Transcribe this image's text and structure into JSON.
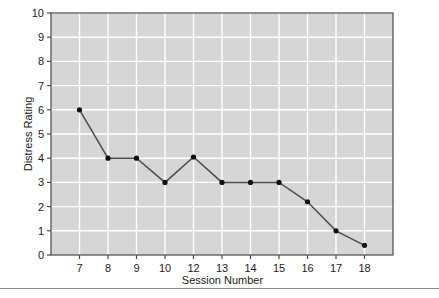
{
  "chart_data": {
    "type": "line",
    "title": "",
    "xlabel": "Session Number",
    "ylabel": "Distress Rating",
    "categories": [
      "7",
      "8",
      "9",
      "10",
      "12",
      "13",
      "14",
      "15",
      "16",
      "17",
      "18"
    ],
    "values": [
      6.0,
      4.0,
      4.0,
      3.0,
      4.05,
      3.0,
      3.0,
      3.0,
      2.2,
      1.0,
      0.4
    ],
    "series": [
      {
        "name": "Distress Rating",
        "values": [
          6.0,
          4.0,
          4.0,
          3.0,
          4.05,
          3.0,
          3.0,
          3.0,
          2.2,
          1.0,
          0.4
        ]
      }
    ],
    "xtick_labels": [
      "7",
      "8",
      "9",
      "10",
      "12",
      "13",
      "14",
      "15",
      "16",
      "17",
      "18"
    ],
    "ytick_labels": [
      "0",
      "1",
      "2",
      "3",
      "4",
      "5",
      "6",
      "7",
      "8",
      "9",
      "10"
    ],
    "ylim": [
      0,
      10
    ],
    "ytick_step": 1,
    "grid": true,
    "grid_color": "#ffffff",
    "plot_background": "#d6d6d6",
    "line_color": "#4d4d4d",
    "marker_color": "#111111",
    "marker_shape": "circle",
    "legend": "none",
    "legend_position": "none",
    "axis_color": "#4a4a4a",
    "text_color": "#1a1a1a"
  },
  "figure": {
    "ylabel": "Distress Rating",
    "xlabel": "Session Number"
  }
}
